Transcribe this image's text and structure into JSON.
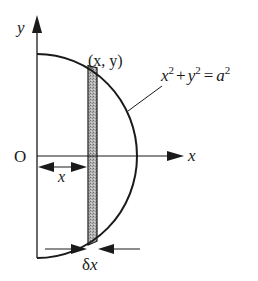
{
  "diagram": {
    "axes": {
      "y_label": "y",
      "x_label": "x",
      "origin_label": "O"
    },
    "point_label": "(x, y)",
    "equation": {
      "x": "x",
      "x_exp": "2",
      "plus": "+",
      "y": "y",
      "y_exp": "2",
      "equals": "=",
      "a": "a",
      "a_exp": "2",
      "full_text": "x² + y² = a²"
    },
    "distance_label": "x",
    "width_label": {
      "delta": "δ",
      "x": "x",
      "full_text": "δx"
    },
    "colors": {
      "ink": "#1a1a1a",
      "strip_fill": "#a8a8a8",
      "background": "#ffffff"
    }
  }
}
